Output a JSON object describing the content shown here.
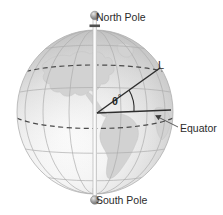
{
  "figure": {
    "labels": {
      "north_pole": "North Pole",
      "south_pole": "South Pole",
      "equator": "Equator",
      "line_L": "L",
      "angle_theta": "θ",
      "angle_degree_symbol": "°"
    },
    "colors": {
      "background": "#ffffff",
      "text": "#2b2b2b",
      "sphere_light": "#fdfdfd",
      "sphere_mid": "#e3e3e3",
      "sphere_dark": "#b9b9b9",
      "gridline": "#a8a8a8",
      "dashed_latitude": "#585858",
      "land": "#cfcfcf",
      "axis_rod": "#ffffff",
      "pole_knob": "#8e8e8e",
      "annotation_line": "#333333",
      "leader_line": "#555555"
    },
    "geometry": {
      "globe_center_x": 95,
      "globe_center_y": 112,
      "globe_radius_x": 78,
      "globe_radius_y": 82,
      "angle_vertex_x": 97,
      "angle_vertex_y": 113
    },
    "elements": {
      "axis": "polar-axis-rod",
      "north_knob": "north-pole-knob",
      "south_knob": "south-pole-knob",
      "equator_dashed": "equator-dashed-line",
      "tropic_dashed": "tropic-dashed-line",
      "radius_line": "radius-line-L",
      "equator_radius_line": "equator-radius-line",
      "angle_arc": "angle-arc",
      "leader": "equator-leader-line"
    }
  }
}
